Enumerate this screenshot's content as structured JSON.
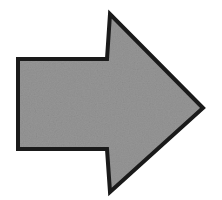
{
  "canvas": {
    "width": 222,
    "height": 200,
    "background_color": "#ffffff",
    "title": "Right-pointing block arrow"
  },
  "figure": {
    "name": "right-arrow",
    "shape_type": "block-arrow",
    "direction": "right",
    "fill_color": "#969696",
    "stroke_color": "#1a1a1a",
    "stroke_width": 4,
    "texture": "scanned-grain",
    "texture_light": "#a0a0a0",
    "texture_dark": "#8a8a8a",
    "points": "18,59 107,59 110,14 203,108 110,192 107,149 18,149",
    "vertices": [
      {
        "name": "shaft-top-left",
        "x": 18,
        "y": 59
      },
      {
        "name": "notch-top",
        "x": 107,
        "y": 59
      },
      {
        "name": "head-top-tip",
        "x": 110,
        "y": 14
      },
      {
        "name": "head-right-point",
        "x": 203,
        "y": 108
      },
      {
        "name": "head-bottom-tip",
        "x": 110,
        "y": 192
      },
      {
        "name": "notch-bottom",
        "x": 107,
        "y": 149
      },
      {
        "name": "shaft-bottom-left",
        "x": 18,
        "y": 149
      }
    ],
    "bounds": {
      "left": 17,
      "top": 13,
      "right": 204,
      "bottom": 193
    }
  }
}
